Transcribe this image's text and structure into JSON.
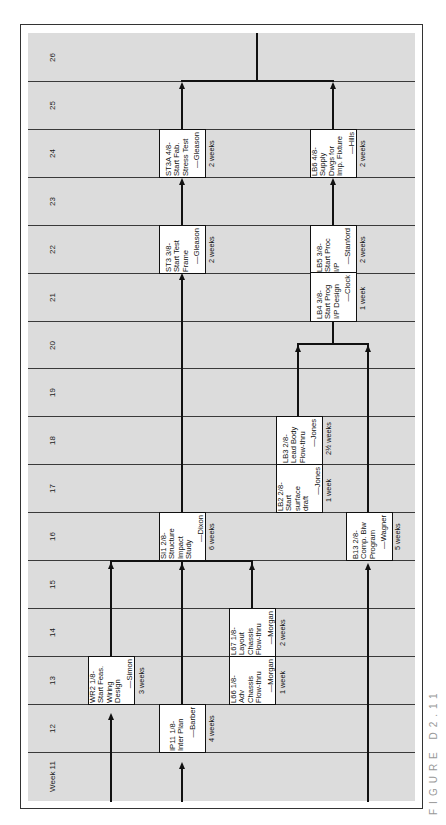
{
  "figure": {
    "caption": "FIGURE D2.11",
    "type": "PERT/network schedule chart (rotated 90° counter-clockwise)"
  },
  "weeks": [
    {
      "label": "26"
    },
    {
      "label": "25"
    },
    {
      "label": "24"
    },
    {
      "label": "23"
    },
    {
      "label": "22"
    },
    {
      "label": "21"
    },
    {
      "label": "20"
    },
    {
      "label": "19"
    },
    {
      "label": "18"
    },
    {
      "label": "17"
    },
    {
      "label": "16"
    },
    {
      "label": "15"
    },
    {
      "label": "14"
    },
    {
      "label": "13"
    },
    {
      "label": "12"
    },
    {
      "label": "Week 11"
    }
  ],
  "tasks": {
    "wr2": {
      "title": "WR2 1/8-\nStart Feas.\nWiring\nDesign",
      "owner": "—Simon",
      "duration": "3 weeks"
    },
    "ip11": {
      "title": "IP11 1/8-\nInter Plan",
      "owner": "—Barber",
      "duration": "4 weeks"
    },
    "l66": {
      "title": "L66 1/8-\nAdv\nChassis\nFlow-thru",
      "owner": "—Morgan",
      "duration": "1 week"
    },
    "l67": {
      "title": "L67 1/8-\nLayout\nChassis\nFlow-thru",
      "owner": "—Morgan",
      "duration": "2 weeks"
    },
    "si1": {
      "title": "SI1 2/8-\nStructure\nImpact\nStudy",
      "owner": "—Dixon",
      "duration": "6 weeks"
    },
    "b13": {
      "title": "B13 2/8-\nComp. Biw\nProgram",
      "owner": "—Wagner",
      "duration": "5 weeks"
    },
    "lb2": {
      "title": "LB2 2/8-\nStart\nsurface\ndraft",
      "owner": "—Jones",
      "duration": "1 week"
    },
    "lb3": {
      "title": "LB3 2/8-\nLead Body\nFlow-thru",
      "owner": "—Jones",
      "duration": "2½ weeks"
    },
    "lb4": {
      "title": "LB4 3/8-\nStart Prog\nI/P Design",
      "owner": "—Clock",
      "duration": "1 week"
    },
    "lb5": {
      "title": "LB5 3/8-\nStart Proc\nI/P",
      "owner": "—Stanford",
      "duration": "2 weeks"
    },
    "st3": {
      "title": "ST3 3/8-\nStart Test\nFrame",
      "owner": "—Gleason",
      "duration": "2 weeks"
    },
    "st3a": {
      "title": "ST3A 4/8-\nStart Fab.\nStress Test",
      "owner": "—Gleason",
      "duration": "2 weeks"
    },
    "lb6": {
      "title": "LB6 4/8-\nSupply\nDwgs for\nImp. Fixture",
      "owner": "—Hills",
      "duration": "2 weeks"
    }
  },
  "colors": {
    "grid_bg": "#dcdcdc",
    "lines": "#111111",
    "box_bg": "#ffffff",
    "caption": "#999999"
  }
}
